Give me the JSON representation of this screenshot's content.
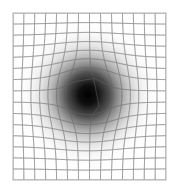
{
  "figure": {
    "background_color": "#ffffff"
  },
  "chart_data": {
    "type": "heatmap",
    "subtitle": "",
    "xlabel": "",
    "ylabel": "",
    "grid": true,
    "legend": "none",
    "plot_area": {
      "left": 13,
      "top": 13,
      "width": 153,
      "height": 167
    },
    "grid_spec": {
      "columns": 14,
      "rows": 15,
      "cell_width": 10.93,
      "cell_height": 11.13,
      "line_color": "#b0b0b0",
      "line_width": 0.8,
      "border_color": "#b4b4b4"
    },
    "distortion": {
      "model": "radial-outward-displacement",
      "center_x": 88,
      "center_y": 95,
      "strength": 13.5,
      "sigma": 34,
      "description": "Each lattice vertex is pushed away from the center by a Gaussian-weighted radial offset, bowing lines outward near the core."
    },
    "shading": {
      "model": "radial-gradient",
      "center_x": 88,
      "center_y": 95,
      "inner_color": "#000000",
      "outer_color": "#ffffff",
      "stops": [
        {
          "offset": 0.0,
          "color": "#000000",
          "opacity": 1.0
        },
        {
          "offset": 0.12,
          "color": "#080808",
          "opacity": 0.97
        },
        {
          "offset": 0.28,
          "color": "#2a2a2a",
          "opacity": 0.82
        },
        {
          "offset": 0.45,
          "color": "#6a6a6a",
          "opacity": 0.55
        },
        {
          "offset": 0.62,
          "color": "#a8a8a8",
          "opacity": 0.3
        },
        {
          "offset": 0.8,
          "color": "#dcdcdc",
          "opacity": 0.11
        },
        {
          "offset": 1.0,
          "color": "#ffffff",
          "opacity": 0.0
        }
      ],
      "radius_x": 78,
      "radius_y": 80
    }
  }
}
